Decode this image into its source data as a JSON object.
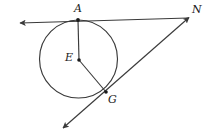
{
  "figure": {
    "background_color": "#ffffff",
    "stroke_color": "#3a3a3a",
    "label_color": "#1a1a1a",
    "labels": {
      "tangent_point": "A",
      "external_point": "N",
      "center": "E",
      "circle_point": "G"
    },
    "points": {
      "A": {
        "x": 78,
        "y": 20,
        "name": "tangent-point-a",
        "marked": true
      },
      "N": {
        "x": 188,
        "y": 18,
        "name": "external-point-n",
        "marked": false
      },
      "E": {
        "x": 79,
        "y": 60,
        "name": "center-point-e",
        "marked": true
      },
      "G": {
        "x": 106,
        "y": 92,
        "name": "circle-point-g",
        "marked": true
      }
    },
    "circle": {
      "cx": 78.5,
      "cy": 59,
      "r": 39,
      "name": "circle-e"
    },
    "segments": [
      {
        "name": "segment-ea",
        "from": "E",
        "to": "A"
      },
      {
        "name": "segment-eg",
        "from": "E",
        "to": "G"
      }
    ],
    "rays": [
      {
        "name": "tangent-line-through-a",
        "from": {
          "x": 18,
          "y": 23
        },
        "to": {
          "x": 188,
          "y": 18
        },
        "arrow_start": true,
        "arrow_end": false
      },
      {
        "name": "secant-line-through-g-to-n",
        "from": {
          "x": 61,
          "y": 130
        },
        "to": {
          "x": 190,
          "y": 17
        },
        "arrow_start": true,
        "arrow_end": true
      }
    ]
  }
}
